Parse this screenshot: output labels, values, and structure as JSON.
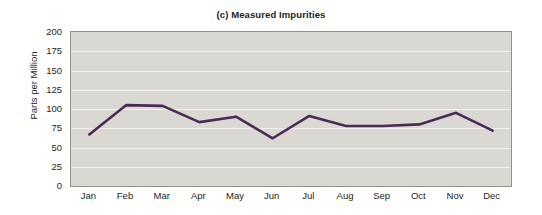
{
  "chart_data": {
    "type": "line",
    "title": "(c) Measured Impurities",
    "xlabel": "",
    "ylabel": "Parts per Million",
    "categories": [
      "Jan",
      "Feb",
      "Mar",
      "Apr",
      "May",
      "Jun",
      "Jul",
      "Aug",
      "Sep",
      "Oct",
      "Nov",
      "Dec"
    ],
    "values": [
      67,
      105,
      104,
      83,
      90,
      62,
      91,
      78,
      78,
      80,
      95,
      72
    ],
    "series": [
      {
        "name": "Measured Impurities",
        "values": [
          67,
          105,
          104,
          83,
          90,
          62,
          91,
          78,
          78,
          80,
          95,
          72
        ],
        "color": "#4b2a56"
      }
    ],
    "ylim": [
      0,
      200
    ],
    "yticks": [
      0,
      25,
      50,
      75,
      100,
      125,
      150,
      175,
      200
    ],
    "ytick_labels": [
      "0",
      "25",
      "50",
      "75",
      "100",
      "125",
      "150",
      "175",
      "200"
    ],
    "grid": true,
    "grid_axis": "y",
    "legend": false,
    "legend_position": "none",
    "plot_background": "#d9d8d2",
    "grid_color": "#f2f1ec",
    "frame_color": "#8f8f8f",
    "figure_background": "#ffffff",
    "text_color": "#231f20"
  }
}
